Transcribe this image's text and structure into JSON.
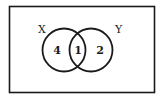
{
  "diagram": {
    "type": "venn",
    "sets": [
      {
        "label": "X",
        "only_count": "4"
      },
      {
        "label": "Y",
        "only_count": "2"
      }
    ],
    "intersection_count": "1",
    "colors": {
      "stroke": "#1a1a1a",
      "background": "#ffffff"
    }
  }
}
